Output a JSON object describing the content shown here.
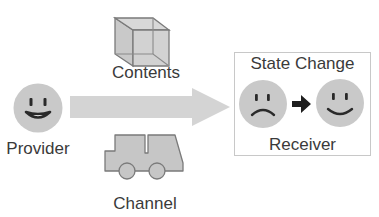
{
  "diagram": {
    "provider": {
      "label": "Provider",
      "face": "happy-face-icon"
    },
    "contents": {
      "label": "Contents",
      "icon": "wireframe-cube-icon"
    },
    "channel": {
      "label": "Channel",
      "icon": "truck-icon"
    },
    "transfer_arrow": {
      "direction": "right",
      "from": "Provider",
      "to": "Receiver"
    },
    "receiver": {
      "label": "Receiver",
      "box_title": "State Change",
      "before_face": "sad-face-icon",
      "after_face": "smiling-face-icon",
      "transition_icon": "right-arrow-icon"
    },
    "colors": {
      "face_fill": "#c9c9c9",
      "icon_fill": "#c6c6c6",
      "arrow_fill": "#d4d4d4",
      "stroke": "#2a2a2a",
      "text": "#3a3a3a",
      "box_border": "#c8c8c8"
    }
  }
}
